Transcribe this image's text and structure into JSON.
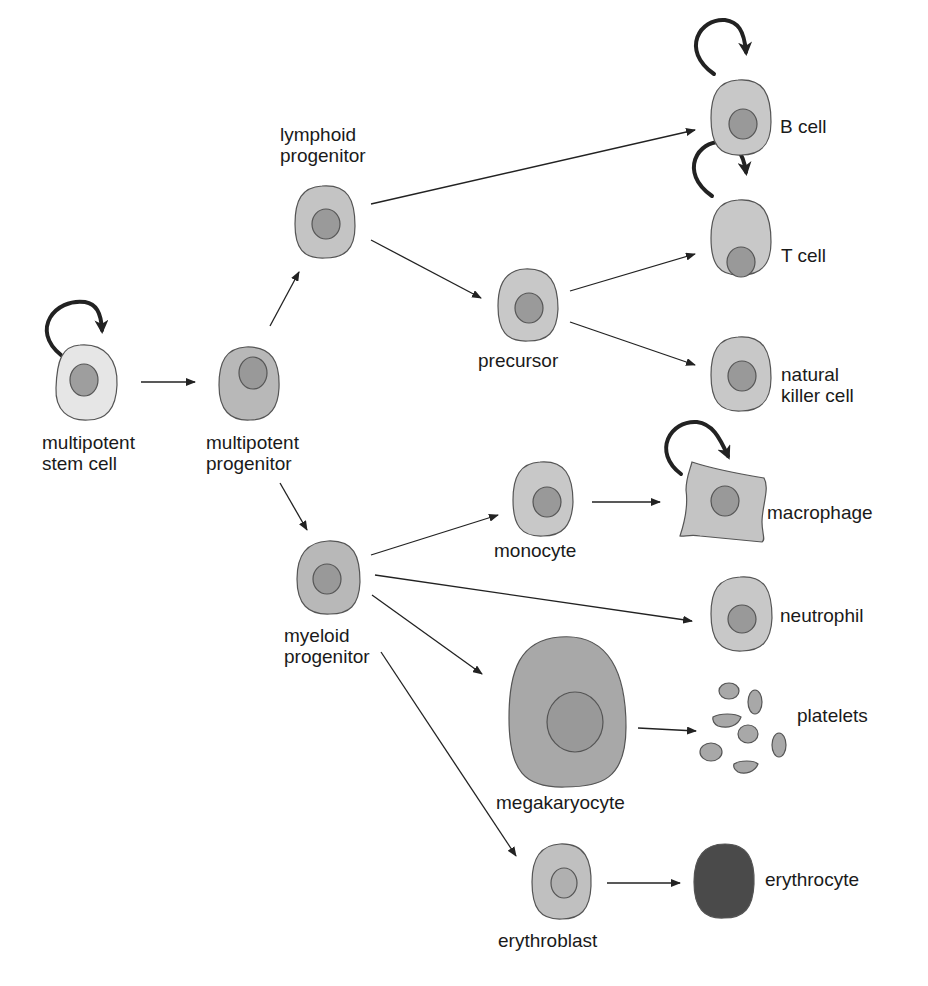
{
  "diagram": {
    "title": "",
    "colors": {
      "stem_cytoplasm": "#e6e6e6",
      "cytoplasm": "#c8c8c8",
      "progenitor_cytoplasm": "#b8b8b8",
      "nucleus": "#9c9c9c",
      "megakaryocyte": "#a8a8a8",
      "erythrocyte": "#4a4a4a",
      "outline": "#555555",
      "arrow": "#222222"
    },
    "nodes": [
      {
        "id": "stem",
        "label_line1": "multipotent",
        "label_line2": "stem cell",
        "self_renewal": true
      },
      {
        "id": "mpp",
        "label_line1": "multipotent",
        "label_line2": "progenitor",
        "self_renewal": false
      },
      {
        "id": "lymphoid",
        "label_line1": "lymphoid",
        "label_line2": "progenitor",
        "self_renewal": false
      },
      {
        "id": "myeloid",
        "label_line1": "myeloid",
        "label_line2": "progenitor",
        "self_renewal": false
      },
      {
        "id": "precursor",
        "label_line1": "precursor",
        "self_renewal": false
      },
      {
        "id": "bcell",
        "label_line1": "B cell",
        "self_renewal": true
      },
      {
        "id": "tcell",
        "label_line1": "T cell",
        "self_renewal": true
      },
      {
        "id": "nk",
        "label_line1": "natural",
        "label_line2": "killer cell",
        "self_renewal": false
      },
      {
        "id": "monocyte",
        "label_line1": "monocyte",
        "self_renewal": false
      },
      {
        "id": "macrophage",
        "label_line1": "macrophage",
        "self_renewal": true
      },
      {
        "id": "neutrophil",
        "label_line1": "neutrophil",
        "self_renewal": false
      },
      {
        "id": "megakaryocyte",
        "label_line1": "megakaryocyte",
        "self_renewal": false
      },
      {
        "id": "platelets",
        "label_line1": "platelets",
        "self_renewal": false
      },
      {
        "id": "erythroblast",
        "label_line1": "erythroblast",
        "self_renewal": false
      },
      {
        "id": "erythrocyte",
        "label_line1": "erythrocyte",
        "self_renewal": false
      }
    ],
    "edges": [
      {
        "from": "stem",
        "to": "mpp"
      },
      {
        "from": "mpp",
        "to": "lymphoid"
      },
      {
        "from": "mpp",
        "to": "myeloid"
      },
      {
        "from": "lymphoid",
        "to": "bcell"
      },
      {
        "from": "lymphoid",
        "to": "precursor"
      },
      {
        "from": "precursor",
        "to": "tcell"
      },
      {
        "from": "precursor",
        "to": "nk"
      },
      {
        "from": "myeloid",
        "to": "monocyte"
      },
      {
        "from": "monocyte",
        "to": "macrophage"
      },
      {
        "from": "myeloid",
        "to": "neutrophil"
      },
      {
        "from": "myeloid",
        "to": "megakaryocyte"
      },
      {
        "from": "megakaryocyte",
        "to": "platelets"
      },
      {
        "from": "myeloid",
        "to": "erythroblast"
      },
      {
        "from": "erythroblast",
        "to": "erythrocyte"
      }
    ]
  }
}
